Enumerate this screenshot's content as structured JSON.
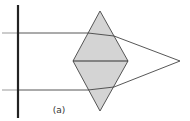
{
  "figure": {
    "label": "(a)"
  },
  "colors": {
    "background": "#ffffff",
    "prism_fill": "#d4d4d4",
    "prism_stroke": "#555555",
    "ray": "#444444",
    "ray_behind_screen": "#aaaaaa",
    "screen": "#222222",
    "arrow": "#222222"
  },
  "elements": {
    "screen": {
      "x": 18,
      "y1": 5,
      "y2": 118
    },
    "prism": {
      "top": [
        100,
        11
      ],
      "left": [
        73,
        61
      ],
      "right": [
        128,
        61
      ],
      "bottom": [
        100,
        111
      ]
    },
    "focus": [
      180,
      61
    ],
    "rays": [
      {
        "name": "upper-ray",
        "start": [
          2,
          33
        ],
        "screen_cross": [
          18,
          33
        ],
        "enter": [
          88,
          33
        ],
        "exit": [
          114,
          36
        ],
        "arrow_in": [
          36,
          33
        ],
        "arrow_out": [
          147,
          48
        ]
      },
      {
        "name": "lower-ray",
        "start": [
          2,
          90
        ],
        "screen_cross": [
          18,
          90
        ],
        "enter": [
          88,
          90
        ],
        "exit": [
          114,
          87
        ],
        "arrow_in": [
          36,
          90
        ],
        "arrow_out": [
          147,
          74
        ]
      }
    ],
    "label_pos": [
      59,
      113
    ]
  }
}
